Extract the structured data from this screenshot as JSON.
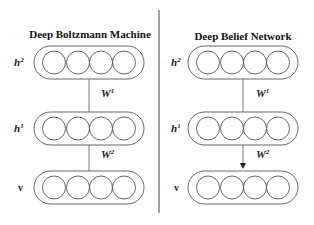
{
  "left_panel": {
    "title": "Deep Boltzmann Machine",
    "layers": [
      {
        "name": "h",
        "sup": "2",
        "units": 4
      },
      {
        "name": "h",
        "sup": "1",
        "units": 4
      },
      {
        "name": "v",
        "sup": "",
        "units": 4
      }
    ],
    "edges": [
      {
        "label": "W",
        "sup": "1",
        "directed": false
      },
      {
        "label": "W",
        "sup": "2",
        "directed": false
      }
    ]
  },
  "right_panel": {
    "title": "Deep Belief Network",
    "layers": [
      {
        "name": "h",
        "sup": "2",
        "units": 4
      },
      {
        "name": "h",
        "sup": "1",
        "units": 4
      },
      {
        "name": "v",
        "sup": "",
        "units": 4
      }
    ],
    "edges": [
      {
        "label": "W",
        "sup": "1",
        "directed": false
      },
      {
        "label": "W",
        "sup": "2",
        "directed": true
      }
    ]
  },
  "colors": {
    "stroke": "#555555",
    "text": "#111111",
    "divider": "#444444"
  }
}
